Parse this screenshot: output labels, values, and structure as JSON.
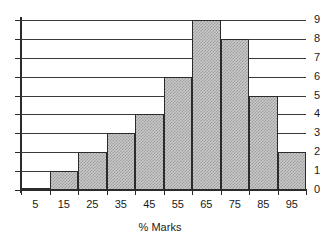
{
  "chart_data": {
    "type": "bar",
    "title": "",
    "subtitle": "",
    "xlabel": "% Marks",
    "ylabel": "",
    "categories": [
      "5",
      "15",
      "25",
      "35",
      "45",
      "55",
      "65",
      "75",
      "85",
      "95"
    ],
    "values": [
      0,
      1,
      2,
      3,
      4,
      6,
      9,
      8,
      5,
      2
    ],
    "series": [
      {
        "name": "Frequency",
        "values": [
          0,
          1,
          2,
          3,
          4,
          6,
          9,
          8,
          5,
          2
        ]
      }
    ],
    "ylim": [
      0,
      9
    ],
    "ytick_labels": [
      "0",
      "1",
      "2",
      "3",
      "4",
      "5",
      "6",
      "7",
      "8",
      "9"
    ],
    "ytick_values": [
      0,
      1,
      2,
      3,
      4,
      5,
      6,
      7,
      8,
      9
    ],
    "xtick_labels": [
      "5",
      "15",
      "25",
      "35",
      "45",
      "55",
      "65",
      "75",
      "85",
      "95"
    ],
    "grid": true,
    "grid_axis": "y",
    "legend": false,
    "legend_position": "none",
    "bar_fill_color": "#c9c9c9",
    "bar_edge_color": "#2b2b2b",
    "axis_color": "#2b2b2b",
    "grid_color": "#3a3a3a",
    "background_color": "#ffffff"
  }
}
